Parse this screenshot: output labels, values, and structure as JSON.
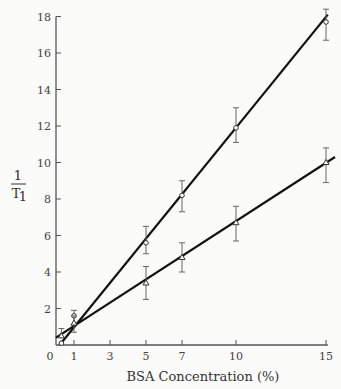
{
  "chart_data": {
    "type": "line",
    "title": "",
    "xlabel": "BSA Concentration (%)",
    "ylabel": "1/T1",
    "ylabel_num": "1",
    "ylabel_den": "T",
    "ylabel_sub": "1",
    "xlim": [
      0,
      16
    ],
    "ylim": [
      0,
      18
    ],
    "xticks": [
      0,
      1,
      3,
      5,
      7,
      10,
      15
    ],
    "yticks": [
      2,
      4,
      6,
      8,
      10,
      12,
      14,
      16,
      18
    ],
    "grid": false,
    "legend": null,
    "series": [
      {
        "name": "upper line",
        "marker": "open circle",
        "x": [
          0.3,
          1,
          5,
          7,
          10,
          15
        ],
        "y": [
          0.1,
          1.6,
          5.6,
          8.2,
          11.9,
          17.7
        ],
        "err_low": [
          null,
          1.1,
          5.0,
          7.3,
          11.1,
          16.7
        ],
        "err_high": [
          null,
          1.9,
          6.5,
          9.0,
          13.0,
          18.4
        ],
        "fit": [
          [
            0.2,
            0
          ],
          [
            15.1,
            18.1
          ]
        ]
      },
      {
        "name": "lower line",
        "marker": "open triangle",
        "x": [
          0.3,
          1,
          5,
          7,
          10,
          15
        ],
        "y": [
          0.5,
          1.2,
          3.4,
          4.8,
          6.7,
          10.0
        ],
        "err_low": [
          null,
          0.7,
          2.5,
          4.0,
          5.7,
          8.9
        ],
        "err_high": [
          0.9,
          1.6,
          4.3,
          5.6,
          7.6,
          10.8
        ],
        "fit": [
          [
            0,
            0.4
          ],
          [
            15.5,
            10.3
          ]
        ]
      }
    ]
  }
}
